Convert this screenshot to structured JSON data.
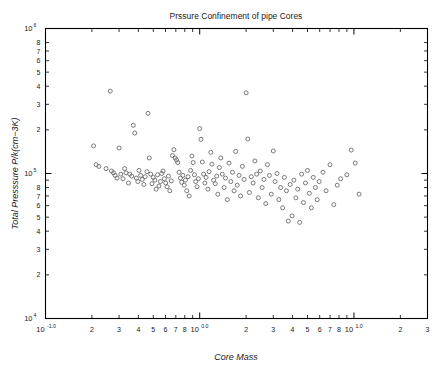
{
  "chart_data": {
    "type": "scatter",
    "title": "Prssure Confinement of pipe Cores",
    "xlabel": "Core Mass",
    "ylabel": "Total Presssure P/k(cm−3K)",
    "xscale": "log",
    "yscale": "log",
    "xlim": [
      0.1,
      30
    ],
    "ylim": [
      10000,
      1000000
    ],
    "grid": false,
    "legend": null,
    "marker": "open-circle",
    "marker_color": "#6b6b6b",
    "marker_size": 4,
    "x_major_ticks": [
      {
        "value": 0.1,
        "label": "10",
        "exponent": "-1.0"
      },
      {
        "value": 1,
        "label": "10",
        "exponent": "0.0"
      },
      {
        "value": 10,
        "label": "10",
        "exponent": "1.0"
      }
    ],
    "x_minor_ticks": [
      {
        "value": 0.2,
        "label": "2"
      },
      {
        "value": 0.3,
        "label": "3"
      },
      {
        "value": 0.4,
        "label": "4"
      },
      {
        "value": 0.5,
        "label": "5"
      },
      {
        "value": 0.6,
        "label": "6"
      },
      {
        "value": 0.7,
        "label": "7"
      },
      {
        "value": 0.8,
        "label": "8"
      },
      {
        "value": 0.9,
        "label": ""
      },
      {
        "value": 2,
        "label": "2"
      },
      {
        "value": 3,
        "label": "3"
      },
      {
        "value": 4,
        "label": "4"
      },
      {
        "value": 5,
        "label": "5"
      },
      {
        "value": 6,
        "label": "6"
      },
      {
        "value": 7,
        "label": "7"
      },
      {
        "value": 8,
        "label": "8"
      },
      {
        "value": 9,
        "label": ""
      },
      {
        "value": 20,
        "label": "2"
      },
      {
        "value": 30,
        "label": "3"
      }
    ],
    "y_major_ticks": [
      {
        "value": 1000000,
        "label": "10",
        "exponent": "6"
      },
      {
        "value": 100000,
        "label": "10",
        "exponent": "5"
      },
      {
        "value": 10000,
        "label": "10",
        "exponent": "4"
      }
    ],
    "y_minor_ticks": [
      {
        "value": 800000,
        "label": "8"
      },
      {
        "value": 700000,
        "label": "7"
      },
      {
        "value": 600000,
        "label": "6"
      },
      {
        "value": 500000,
        "label": "5"
      },
      {
        "value": 400000,
        "label": "4"
      },
      {
        "value": 300000,
        "label": "3"
      },
      {
        "value": 200000,
        "label": "2"
      },
      {
        "value": 90000,
        "label": ""
      },
      {
        "value": 80000,
        "label": "8"
      },
      {
        "value": 70000,
        "label": "7"
      },
      {
        "value": 60000,
        "label": "6"
      },
      {
        "value": 50000,
        "label": "5"
      },
      {
        "value": 40000,
        "label": "4"
      },
      {
        "value": 30000,
        "label": "3"
      },
      {
        "value": 20000,
        "label": "2"
      }
    ],
    "points": [
      [
        0.205,
        155000
      ],
      [
        0.213,
        115000
      ],
      [
        0.222,
        112000
      ],
      [
        0.247,
        108000
      ],
      [
        0.263,
        370000
      ],
      [
        0.268,
        104000
      ],
      [
        0.276,
        101000
      ],
      [
        0.283,
        97000
      ],
      [
        0.291,
        93000
      ],
      [
        0.3,
        150000
      ],
      [
        0.308,
        99000
      ],
      [
        0.318,
        92000
      ],
      [
        0.326,
        108000
      ],
      [
        0.333,
        101000
      ],
      [
        0.345,
        86000
      ],
      [
        0.352,
        99000
      ],
      [
        0.362,
        96000
      ],
      [
        0.371,
        215000
      ],
      [
        0.379,
        190000
      ],
      [
        0.388,
        93000
      ],
      [
        0.397,
        88000
      ],
      [
        0.404,
        105000
      ],
      [
        0.414,
        97000
      ],
      [
        0.424,
        91000
      ],
      [
        0.434,
        84000
      ],
      [
        0.443,
        95000
      ],
      [
        0.455,
        103000
      ],
      [
        0.462,
        260000
      ],
      [
        0.471,
        128000
      ],
      [
        0.481,
        99000
      ],
      [
        0.49,
        85000
      ],
      [
        0.5,
        94000
      ],
      [
        0.512,
        90000
      ],
      [
        0.522,
        78000
      ],
      [
        0.533,
        98000
      ],
      [
        0.544,
        82000
      ],
      [
        0.556,
        88000
      ],
      [
        0.567,
        100000
      ],
      [
        0.578,
        104000
      ],
      [
        0.59,
        92000
      ],
      [
        0.602,
        86000
      ],
      [
        0.614,
        81000
      ],
      [
        0.627,
        96000
      ],
      [
        0.64,
        76000
      ],
      [
        0.654,
        89000
      ],
      [
        0.666,
        133000
      ],
      [
        0.68,
        146000
      ],
      [
        0.693,
        128000
      ],
      [
        0.707,
        124000
      ],
      [
        0.72,
        119000
      ],
      [
        0.735,
        102000
      ],
      [
        0.75,
        93000
      ],
      [
        0.763,
        87000
      ],
      [
        0.778,
        97000
      ],
      [
        0.794,
        83000
      ],
      [
        0.808,
        90000
      ],
      [
        0.824,
        76000
      ],
      [
        0.84,
        95000
      ],
      [
        0.855,
        70000
      ],
      [
        0.873,
        105000
      ],
      [
        0.89,
        132000
      ],
      [
        0.907,
        119000
      ],
      [
        0.924,
        98000
      ],
      [
        0.942,
        88000
      ],
      [
        0.96,
        81000
      ],
      [
        0.98,
        92000
      ],
      [
        1.0,
        204000
      ],
      [
        1.02,
        172000
      ],
      [
        1.04,
        120000
      ],
      [
        1.06,
        99000
      ],
      [
        1.08,
        86000
      ],
      [
        1.1,
        94000
      ],
      [
        1.13,
        78000
      ],
      [
        1.15,
        103000
      ],
      [
        1.18,
        140000
      ],
      [
        1.2,
        116000
      ],
      [
        1.23,
        90000
      ],
      [
        1.26,
        85000
      ],
      [
        1.29,
        96000
      ],
      [
        1.31,
        72000
      ],
      [
        1.34,
        110000
      ],
      [
        1.37,
        128000
      ],
      [
        1.4,
        99000
      ],
      [
        1.44,
        80000
      ],
      [
        1.47,
        93000
      ],
      [
        1.51,
        66000
      ],
      [
        1.55,
        118000
      ],
      [
        1.59,
        88000
      ],
      [
        1.63,
        102000
      ],
      [
        1.67,
        76000
      ],
      [
        1.71,
        142000
      ],
      [
        1.75,
        83000
      ],
      [
        1.8,
        97000
      ],
      [
        1.84,
        70000
      ],
      [
        1.89,
        112000
      ],
      [
        1.94,
        91000
      ],
      [
        2.0,
        360000
      ],
      [
        2.05,
        173000
      ],
      [
        2.1,
        74000
      ],
      [
        2.16,
        95000
      ],
      [
        2.22,
        86000
      ],
      [
        2.28,
        122000
      ],
      [
        2.34,
        99000
      ],
      [
        2.4,
        68000
      ],
      [
        2.47,
        104000
      ],
      [
        2.54,
        80000
      ],
      [
        2.61,
        91000
      ],
      [
        2.68,
        62000
      ],
      [
        2.75,
        115000
      ],
      [
        2.83,
        97000
      ],
      [
        2.91,
        72000
      ],
      [
        3.0,
        143000
      ],
      [
        3.08,
        88000
      ],
      [
        3.17,
        100000
      ],
      [
        3.26,
        66000
      ],
      [
        3.35,
        80000
      ],
      [
        3.45,
        58000
      ],
      [
        3.54,
        94000
      ],
      [
        3.65,
        76000
      ],
      [
        3.75,
        47000
      ],
      [
        3.86,
        84000
      ],
      [
        3.97,
        51000
      ],
      [
        4.08,
        90000
      ],
      [
        4.2,
        68000
      ],
      [
        4.32,
        78000
      ],
      [
        4.45,
        46000
      ],
      [
        4.58,
        99000
      ],
      [
        4.71,
        63000
      ],
      [
        4.85,
        86000
      ],
      [
        5.0,
        105000
      ],
      [
        5.14,
        73000
      ],
      [
        5.3,
        58000
      ],
      [
        5.45,
        94000
      ],
      [
        5.62,
        80000
      ],
      [
        5.78,
        66000
      ],
      [
        5.95,
        88000
      ],
      [
        6.3,
        102000
      ],
      [
        6.6,
        76000
      ],
      [
        7.0,
        115000
      ],
      [
        7.4,
        61000
      ],
      [
        7.8,
        83000
      ],
      [
        8.2,
        92000
      ],
      [
        9.0,
        98000
      ],
      [
        9.6,
        145000
      ],
      [
        10.2,
        118000
      ],
      [
        10.8,
        72000
      ]
    ]
  }
}
